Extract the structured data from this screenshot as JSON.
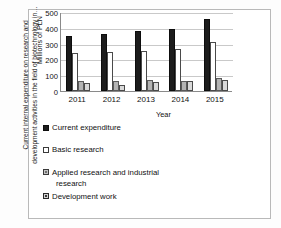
{
  "chart_data": {
    "type": "bar",
    "title": "",
    "xlabel": "Year",
    "ylabel": "Millions of PLN",
    "outer_axis_title": "Current internal expenditure on research and development activities in the field of biotechnology in…",
    "categories": [
      "2011",
      "2012",
      "2013",
      "2014",
      "2015"
    ],
    "ylim": [
      0,
      500
    ],
    "yticks": [
      0,
      100,
      200,
      300,
      400,
      500
    ],
    "ytick_labels": [
      "0",
      "100",
      "200",
      "300",
      "400",
      "500"
    ],
    "grid": true,
    "legend_position": "bottom-left",
    "series": [
      {
        "name": "Current expenditure",
        "color": "#1c1c1c",
        "values": [
          350,
          360,
          378,
          393,
          455
        ]
      },
      {
        "name": "Basic research",
        "color": "#ffffff",
        "values": [
          242,
          250,
          253,
          268,
          310
        ]
      },
      {
        "name": "Applied research and industrial research",
        "color": "#b3b3b3",
        "values": [
          65,
          65,
          70,
          65,
          80
        ]
      },
      {
        "name": "Development work",
        "color": "#d9d9d9",
        "values": [
          48,
          40,
          60,
          65,
          72
        ]
      }
    ]
  },
  "legend": {
    "items": [
      {
        "label": "Current expenditure",
        "swatch": "sw-current"
      },
      {
        "label": "Basic research",
        "swatch": "sw-basic"
      },
      {
        "label": "Applied research and industrial",
        "swatch": "sw-applied",
        "continuation": "research"
      },
      {
        "label": "Development work",
        "swatch": "sw-development"
      }
    ]
  }
}
